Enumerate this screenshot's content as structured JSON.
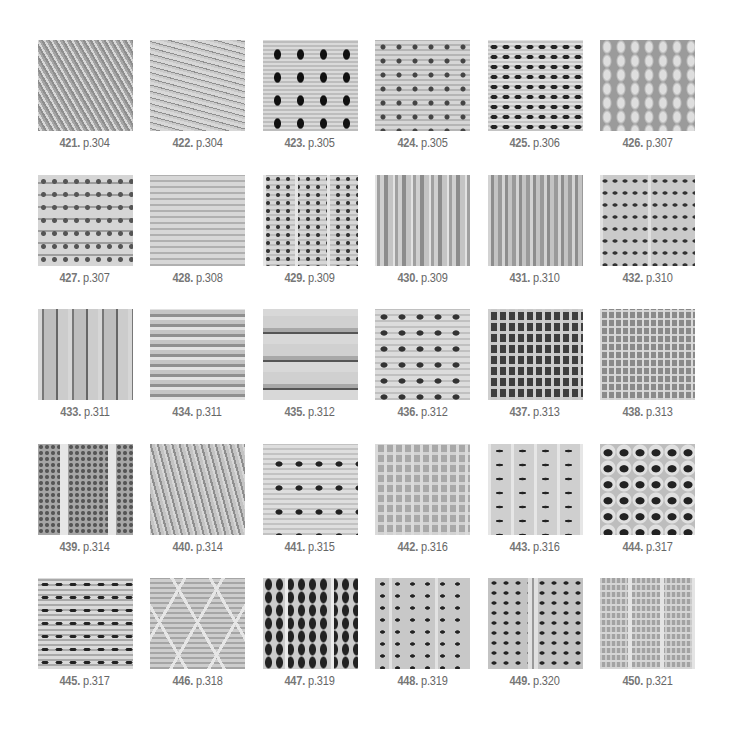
{
  "rows": [
    {
      "items": [
        {
          "number": "421.",
          "page": "p.304",
          "texture": "t-diag"
        },
        {
          "number": "422.",
          "page": "p.304",
          "texture": "t-wavy"
        },
        {
          "number": "423.",
          "page": "p.305",
          "texture": "t-diamond"
        },
        {
          "number": "424.",
          "page": "p.305",
          "texture": "t-dots"
        },
        {
          "number": "425.",
          "page": "p.306",
          "texture": "t-arches"
        },
        {
          "number": "426.",
          "page": "p.307",
          "texture": "t-drops"
        }
      ]
    },
    {
      "items": [
        {
          "number": "427.",
          "page": "p.307",
          "texture": "t-blocks"
        },
        {
          "number": "428.",
          "page": "p.308",
          "texture": "t-light"
        },
        {
          "number": "429.",
          "page": "p.309",
          "texture": "t-vcols"
        },
        {
          "number": "430.",
          "page": "p.309",
          "texture": "t-vribs"
        },
        {
          "number": "431.",
          "page": "p.310",
          "texture": "t-vribs2"
        },
        {
          "number": "432.",
          "page": "p.310",
          "texture": "t-ladder"
        }
      ]
    },
    {
      "items": [
        {
          "number": "433.",
          "page": "p.311",
          "texture": "t-cables"
        },
        {
          "number": "434.",
          "page": "p.311",
          "texture": "t-hstripes"
        },
        {
          "number": "435.",
          "page": "p.312",
          "texture": "t-bands"
        },
        {
          "number": "436.",
          "page": "p.312",
          "texture": "t-mesh"
        },
        {
          "number": "437.",
          "page": "p.313",
          "texture": "t-grid-dark"
        },
        {
          "number": "438.",
          "page": "p.313",
          "texture": "t-grid-fine"
        }
      ]
    },
    {
      "items": [
        {
          "number": "439.",
          "page": "p.314",
          "texture": "t-vpanel"
        },
        {
          "number": "440.",
          "page": "p.314",
          "texture": "t-rough"
        },
        {
          "number": "441.",
          "page": "p.315",
          "texture": "t-lace"
        },
        {
          "number": "442.",
          "page": "p.316",
          "texture": "t-check"
        },
        {
          "number": "443.",
          "page": "p.316",
          "texture": "t-shells"
        },
        {
          "number": "444.",
          "page": "p.317",
          "texture": "t-holes"
        }
      ]
    },
    {
      "items": [
        {
          "number": "445.",
          "page": "p.317",
          "texture": "t-wave-ribs"
        },
        {
          "number": "446.",
          "page": "p.318",
          "texture": "t-hex"
        },
        {
          "number": "447.",
          "page": "p.319",
          "texture": "t-chevron"
        },
        {
          "number": "448.",
          "page": "p.319",
          "texture": "t-lacerib"
        },
        {
          "number": "449.",
          "page": "p.320",
          "texture": "t-centerrib"
        },
        {
          "number": "450.",
          "page": "p.321",
          "texture": "t-colgrid"
        }
      ]
    }
  ]
}
